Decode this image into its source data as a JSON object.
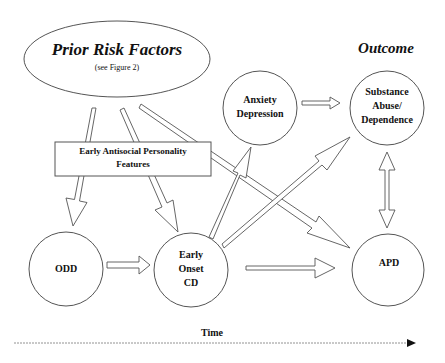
{
  "diagram": {
    "nodes": {
      "prior_risk": {
        "title": "Prior Risk Factors",
        "subtitle": "(see Figure 2)"
      },
      "early_antisocial": {
        "line1": "Early Antisocial Personality",
        "line2": "Features"
      },
      "anxiety": {
        "line1": "Anxiety",
        "line2": "Depression"
      },
      "substance": {
        "line1": "Substance",
        "line2": "Abuse/",
        "line3": "Dependence"
      },
      "odd": {
        "label": "ODD"
      },
      "early_cd": {
        "line1": "Early",
        "line2": "Onset",
        "line3": "CD"
      },
      "apd": {
        "label": "APD"
      }
    },
    "outcome_heading": "Outcome",
    "time_label": "Time",
    "edges": [
      {
        "from": "Prior Risk Factors",
        "to": "ODD"
      },
      {
        "from": "Prior Risk Factors",
        "to": "Early Onset CD"
      },
      {
        "from": "Prior Risk Factors",
        "to": "APD"
      },
      {
        "from": "ODD",
        "to": "Early Onset CD"
      },
      {
        "from": "Early Onset CD",
        "to": "Anxiety Depression"
      },
      {
        "from": "Early Onset CD",
        "to": "Substance Abuse/Dependence"
      },
      {
        "from": "Early Onset CD",
        "to": "APD"
      },
      {
        "from": "Anxiety Depression",
        "to": "Substance Abuse/Dependence"
      },
      {
        "from": "Substance Abuse/Dependence",
        "to": "APD",
        "bidirectional": true
      }
    ],
    "colors": {
      "stroke": "#555555",
      "text": "#111111",
      "background": "#ffffff"
    }
  }
}
